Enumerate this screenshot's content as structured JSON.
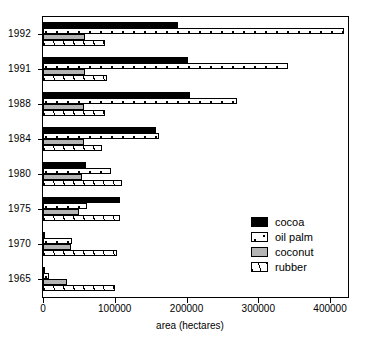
{
  "chart_data": {
    "type": "bar",
    "orientation": "horizontal",
    "title": "",
    "xlabel": "area (hectares)",
    "ylabel": "",
    "xlim": [
      0,
      425000
    ],
    "xticks": [
      0,
      100000,
      200000,
      300000,
      400000
    ],
    "xtick_labels": [
      "0",
      "100000",
      "200000",
      "300000",
      "400000"
    ],
    "grid": false,
    "legend_position": "lower right",
    "categories": [
      "1992",
      "1991",
      "1988",
      "1984",
      "1980",
      "1975",
      "1970",
      "1965"
    ],
    "series": [
      {
        "name": "cocoa",
        "pattern": "solid-black",
        "color": "#000000",
        "values": [
          188000,
          202000,
          205000,
          158000,
          60000,
          107000,
          3000,
          1000
        ]
      },
      {
        "name": "oil palm",
        "pattern": "white-dotted",
        "color": "#ffffff",
        "values": [
          420000,
          341000,
          270000,
          161000,
          95000,
          61000,
          41000,
          9000
        ]
      },
      {
        "name": "coconut",
        "pattern": "solid-gray",
        "color": "#b4b4b4",
        "values": [
          58000,
          58000,
          57000,
          57000,
          54000,
          50000,
          39000,
          34000
        ]
      },
      {
        "name": "rubber",
        "pattern": "diagonal-hatch",
        "color": "#ffffff",
        "values": [
          86000,
          89000,
          87000,
          82000,
          110000,
          107000,
          103000,
          101000
        ]
      }
    ]
  },
  "legend": {
    "items": [
      {
        "label": "cocoa"
      },
      {
        "label": "oil palm"
      },
      {
        "label": "coconut"
      },
      {
        "label": "rubber"
      }
    ]
  },
  "axis": {
    "x_title": "area (hectares)"
  }
}
